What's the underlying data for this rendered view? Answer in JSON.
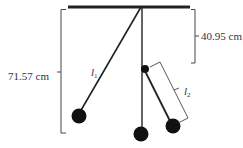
{
  "diagram": {
    "type": "pendulum-setup",
    "labels": {
      "total_length": "71.57 cm",
      "upper_length": "40.95 cm",
      "l1_symbol": "l",
      "l1_subscript": "1",
      "l2_symbol": "l",
      "l2_subscript": "2"
    },
    "colors": {
      "line": "#222222",
      "bob": "#111111",
      "bracket": "#444444",
      "text": "#333333"
    }
  }
}
